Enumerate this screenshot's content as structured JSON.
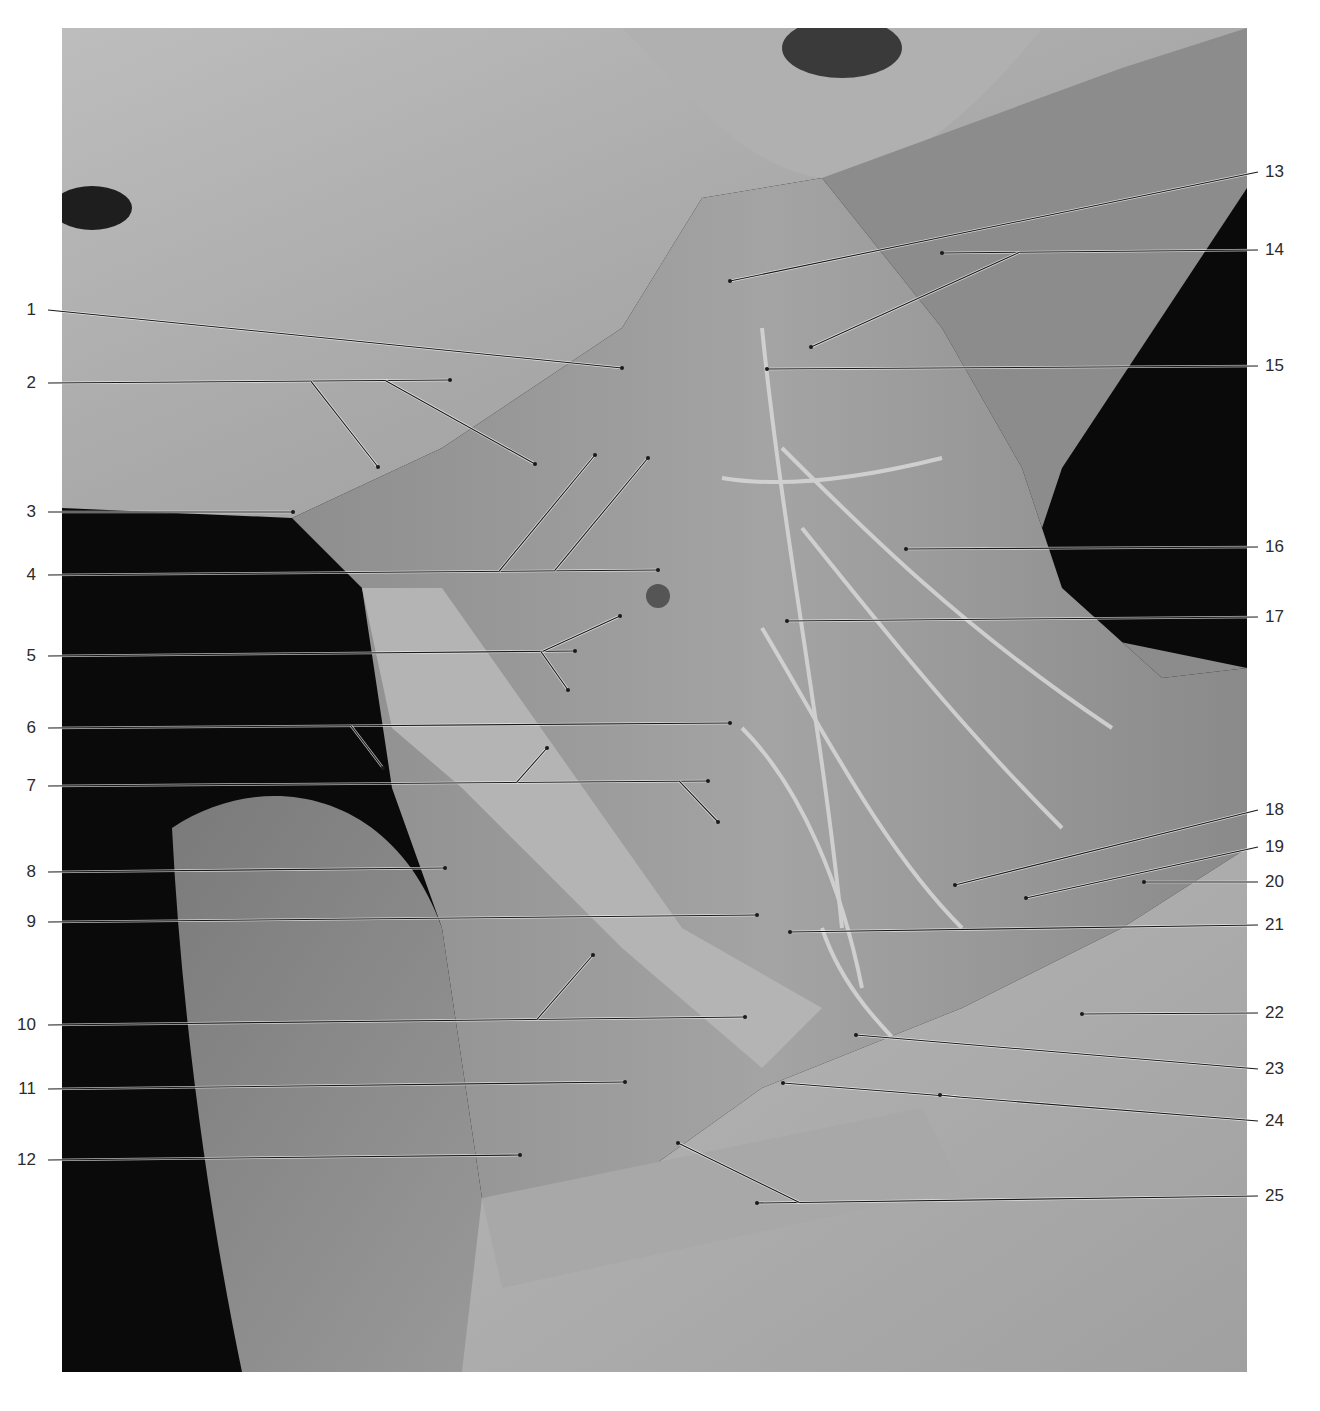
{
  "figure": {
    "background_color": "#ffffff",
    "photo_background": "#0a0a0a",
    "label_color": "#2b2b2b",
    "leader_line_color": "#1a1a1a"
  },
  "labels_left": [
    {
      "n": "1",
      "y": 310,
      "targets": [
        [
          622,
          368
        ]
      ]
    },
    {
      "n": "2",
      "y": 383,
      "targets": [
        [
          450,
          380
        ],
        [
          378,
          467
        ],
        [
          535,
          464
        ]
      ]
    },
    {
      "n": "3",
      "y": 512,
      "targets": [
        [
          293,
          512
        ]
      ]
    },
    {
      "n": "4",
      "y": 575,
      "targets": [
        [
          658,
          570
        ],
        [
          595,
          455
        ],
        [
          648,
          458
        ]
      ]
    },
    {
      "n": "5",
      "y": 656,
      "targets": [
        [
          575,
          651
        ],
        [
          620,
          616
        ],
        [
          568,
          690
        ]
      ]
    },
    {
      "n": "6",
      "y": 728,
      "targets": [
        [
          730,
          723
        ],
        [
          383,
          768
        ]
      ]
    },
    {
      "n": "7",
      "y": 786,
      "targets": [
        [
          708,
          781
        ],
        [
          547,
          748
        ],
        [
          718,
          822
        ]
      ]
    },
    {
      "n": "8",
      "y": 872,
      "targets": [
        [
          445,
          868
        ]
      ]
    },
    {
      "n": "9",
      "y": 922,
      "targets": [
        [
          757,
          915
        ]
      ]
    },
    {
      "n": "10",
      "y": 1025,
      "targets": [
        [
          745,
          1017
        ],
        [
          593,
          955
        ]
      ]
    },
    {
      "n": "11",
      "y": 1089,
      "targets": [
        [
          625,
          1082
        ]
      ]
    },
    {
      "n": "12",
      "y": 1160,
      "targets": [
        [
          520,
          1155
        ]
      ]
    }
  ],
  "labels_right": [
    {
      "n": "13",
      "y": 172,
      "targets": [
        [
          730,
          281
        ]
      ]
    },
    {
      "n": "14",
      "y": 250,
      "targets": [
        [
          942,
          253
        ],
        [
          811,
          347
        ]
      ]
    },
    {
      "n": "15",
      "y": 366,
      "targets": [
        [
          767,
          369
        ]
      ]
    },
    {
      "n": "16",
      "y": 547,
      "targets": [
        [
          906,
          549
        ]
      ]
    },
    {
      "n": "17",
      "y": 617,
      "targets": [
        [
          787,
          621
        ]
      ]
    },
    {
      "n": "18",
      "y": 810,
      "targets": [
        [
          955,
          885
        ]
      ]
    },
    {
      "n": "19",
      "y": 847,
      "targets": [
        [
          1026,
          898
        ]
      ]
    },
    {
      "n": "20",
      "y": 882,
      "targets": [
        [
          1144,
          882
        ]
      ]
    },
    {
      "n": "21",
      "y": 925,
      "targets": [
        [
          790,
          932
        ]
      ]
    },
    {
      "n": "22",
      "y": 1013,
      "targets": [
        [
          1082,
          1014
        ]
      ]
    },
    {
      "n": "23",
      "y": 1069,
      "targets": [
        [
          856,
          1035
        ]
      ]
    },
    {
      "n": "24",
      "y": 1121,
      "targets": [
        [
          783,
          1083
        ],
        [
          940,
          1095
        ]
      ]
    },
    {
      "n": "25",
      "y": 1196,
      "targets": [
        [
          757,
          1203
        ],
        [
          678,
          1143
        ]
      ]
    }
  ]
}
